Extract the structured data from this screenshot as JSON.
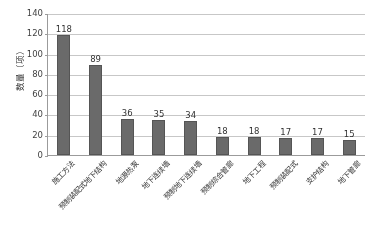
{
  "chart_data": {
    "type": "bar",
    "title": "",
    "xlabel": "",
    "ylabel": "数量（项）",
    "ylim": [
      0,
      140
    ],
    "ytick_step": 20,
    "yticks": [
      0,
      20,
      40,
      60,
      80,
      100,
      120,
      140
    ],
    "grid": true,
    "legend": "none",
    "bar_color": "#666666",
    "categories": [
      "施工方法",
      "预制装配式地下结构",
      "地源热泵",
      "地下连续墙",
      "预制地下连续墙",
      "预制综合管廊",
      "地下工程",
      "预制装配式",
      "支护结构",
      "地下管廊"
    ],
    "values": [
      118,
      89,
      36,
      35,
      34,
      18,
      18,
      17,
      17,
      15
    ],
    "data_labels": [
      "118",
      "89",
      "36",
      "35",
      "34",
      "18",
      "18",
      "17",
      "17",
      "15"
    ]
  }
}
